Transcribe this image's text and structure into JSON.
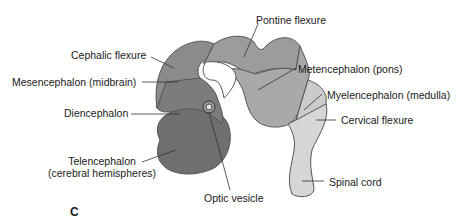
{
  "figure": {
    "panel_letter": "C",
    "labels": {
      "pontine_flexure": "Pontine flexure",
      "cephalic_flexure": "Cephalic flexure",
      "mesencephalon": "Mesencephalon (midbrain)",
      "diencephalon": "Diencephalon",
      "telencephalon_line1": "Telencephalon",
      "telencephalon_line2": "(cerebral hemispheres)",
      "optic_vesicle": "Optic vesicle",
      "metencephalon": "Metencephalon (pons)",
      "myelencephalon": "Myelencephalon (medulla)",
      "cervical_flexure": "Cervical flexure",
      "spinal_cord": "Spinal cord"
    },
    "colors": {
      "telencephalon": "#6e6e6e",
      "diencephalon": "#7a7a7a",
      "mesencephalon": "#8a8a8a",
      "metencephalon": "#a8a8a8",
      "myelencephalon": "#cccccc",
      "spinal_cord": "#d6d6d6",
      "outline": "#555555",
      "leader": "#333333"
    }
  }
}
